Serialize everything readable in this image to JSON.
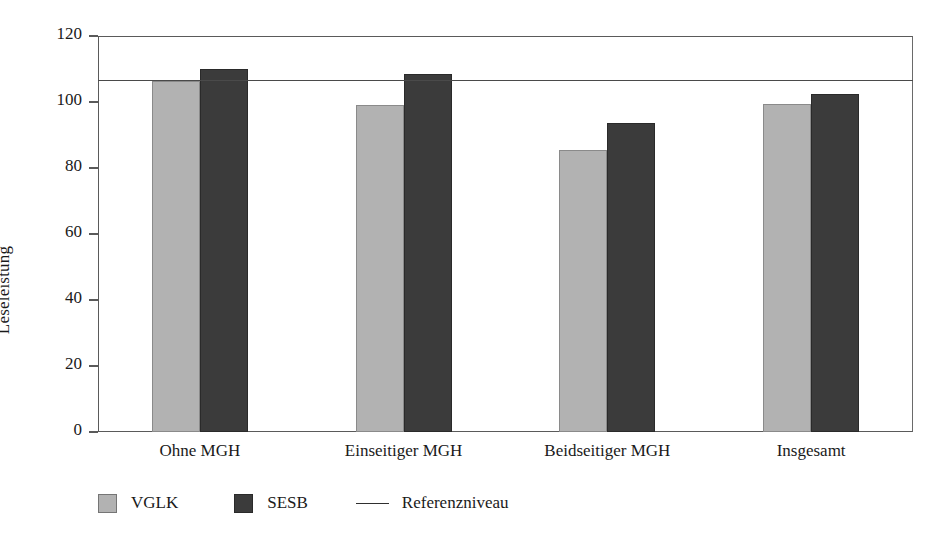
{
  "chart_data": {
    "type": "bar",
    "title": "",
    "xlabel": "",
    "ylabel": "Leseleistung",
    "ylim": [
      0,
      120
    ],
    "yticks": [
      0,
      20,
      40,
      60,
      80,
      100,
      120
    ],
    "grid": false,
    "legend_position": "bottom-left",
    "categories": [
      "Ohne MGH",
      "Einseitiger MGH",
      "Beidseitiger MGH",
      "Insgesamt"
    ],
    "series": [
      {
        "name": "VGLK",
        "color": "#b2b2b2",
        "values": [
          106.5,
          99.0,
          85.5,
          99.5
        ]
      },
      {
        "name": "SESB",
        "color": "#3b3b3b",
        "values": [
          110.0,
          108.5,
          93.5,
          102.5
        ]
      }
    ],
    "annotations": [
      {
        "name": "Referenzniveau",
        "type": "hline",
        "value": 106.5,
        "color": "#4a4a4a"
      }
    ]
  },
  "axis": {
    "y_title": "Leseleistung",
    "tick_labels": [
      "0",
      "20",
      "40",
      "60",
      "80",
      "100",
      "120"
    ]
  },
  "legend": {
    "items": [
      {
        "label": "VGLK",
        "marker": "square-light"
      },
      {
        "label": "SESB",
        "marker": "square-dark"
      },
      {
        "label": "Referenzniveau",
        "marker": "line"
      }
    ]
  }
}
